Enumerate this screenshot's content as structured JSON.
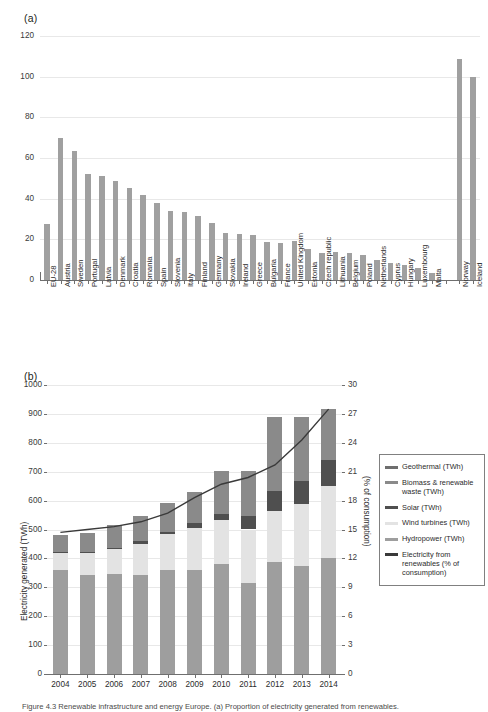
{
  "figure": {
    "caption": "Figure 4.3  Renewable infrastructure and energy Europe. (a) Proportion of electricity generated from renewables.",
    "panel_a_tag": "(a)",
    "panel_b_tag": "(b)"
  },
  "chart_data": [
    {
      "type": "bar",
      "panel": "(a)",
      "title": "",
      "xlabel": "",
      "ylabel": "",
      "ylim": [
        0,
        120
      ],
      "yticks": [
        0,
        20,
        40,
        60,
        80,
        100,
        120
      ],
      "grid": true,
      "legend": "none",
      "bar_color": "#a0a0a0",
      "categories": [
        "EU-28",
        "Austria",
        "Sweden",
        "Portugal",
        "Latvia",
        "Denmark",
        "Croatia",
        "Romania",
        "Spain",
        "Slovenia",
        "Italy",
        "Finland",
        "Germany",
        "Slovakia",
        "Ireland",
        "Greece",
        "Bulgaria",
        "France",
        "United Kingdom",
        "Estonia",
        "Czech republic",
        "Lithuania",
        "Belgium",
        "Poland",
        "Netherlands",
        "Cyprus",
        "Hungary",
        "Luxembourg",
        "Malta",
        "",
        "Norway",
        "Iceland"
      ],
      "values": [
        27.5,
        70.0,
        63.3,
        52.1,
        51.1,
        48.5,
        45.3,
        41.7,
        37.8,
        33.9,
        33.4,
        31.4,
        28.2,
        22.9,
        22.7,
        21.9,
        18.9,
        18.3,
        19.3,
        15.3,
        13.4,
        13.7,
        13.4,
        12.4,
        10.0,
        8.4,
        7.3,
        5.9,
        3.6,
        null,
        108.9,
        100.0
      ]
    },
    {
      "type": "bar",
      "panel": "(b)",
      "stacked": true,
      "title": "",
      "xlabel": "",
      "ylabel": "Electricity generated (TWh)",
      "y2label": "(% of consumption)",
      "ylim": [
        0,
        1000
      ],
      "yticks": [
        0,
        100,
        200,
        300,
        400,
        500,
        600,
        700,
        800,
        900,
        1000
      ],
      "y2lim": [
        0,
        30
      ],
      "y2ticks": [
        0,
        3,
        6,
        9,
        12,
        15,
        18,
        21,
        24,
        27,
        30
      ],
      "grid": true,
      "legend_position": "right",
      "categories": [
        "2004",
        "2005",
        "2006",
        "2007",
        "2008",
        "2009",
        "2010",
        "2011",
        "2012",
        "2013",
        "2014"
      ],
      "series": [
        {
          "name": "Hydropower (TWh)",
          "color": "#9e9e9e",
          "values": [
            360,
            343,
            347,
            341,
            361,
            360,
            382,
            316,
            386,
            375,
            400
          ]
        },
        {
          "name": "Wind turbines (TWh)",
          "color": "#e3e3e3",
          "values": [
            60,
            75,
            85,
            110,
            122,
            146,
            150,
            184,
            178,
            212,
            250
          ]
        },
        {
          "name": "Solar (TWh)",
          "color": "#4f4f4f",
          "values": [
            2,
            3,
            5,
            8,
            10,
            15,
            23,
            46,
            70,
            80,
            90
          ]
        },
        {
          "name": "Biomass & renewable waste (TWh)",
          "color": "#8a8a8a",
          "values": [
            60,
            68,
            77,
            86,
            98,
            110,
            148,
            158,
            255,
            222,
            178
          ]
        },
        {
          "name": "Geothermal (TWh)",
          "color": "#6e6e6e",
          "values": [
            0,
            0,
            0,
            0,
            0,
            0,
            0,
            0,
            0,
            0,
            0
          ]
        }
      ],
      "totals": [
        482,
        489,
        514,
        545,
        591,
        631,
        703,
        704,
        889,
        889,
        918
      ],
      "line": {
        "name": "Electricity from renewables (% of consumption)",
        "color": "#3a3a3a",
        "values": [
          14.7,
          15.0,
          15.3,
          15.8,
          16.7,
          18.3,
          19.7,
          20.4,
          21.7,
          24.3,
          27.5
        ]
      }
    }
  ],
  "panel_b": {
    "legend": {
      "items": [
        {
          "label": "Geothermal (TWh)",
          "swatch": "#6e6e6e",
          "type": "line-swatch"
        },
        {
          "label": "Biomass & renewable waste (TWh)",
          "swatch": "#8a8a8a",
          "type": "line-swatch"
        },
        {
          "label": "Solar (TWh)",
          "swatch": "#4f4f4f",
          "type": "line-swatch"
        },
        {
          "label": "Wind turbines (TWh)",
          "swatch": "#e3e3e3",
          "type": "line-swatch"
        },
        {
          "label": "Hydropower (TWh)",
          "swatch": "#9e9e9e",
          "type": "line-swatch"
        },
        {
          "label": "Electricity from renewables (% of consumption)",
          "swatch": "#3a3a3a",
          "type": "line-swatch"
        }
      ]
    },
    "y_axis_title": "Electricity generated (TWh)",
    "y2_axis_title": "(% of consumption)"
  }
}
